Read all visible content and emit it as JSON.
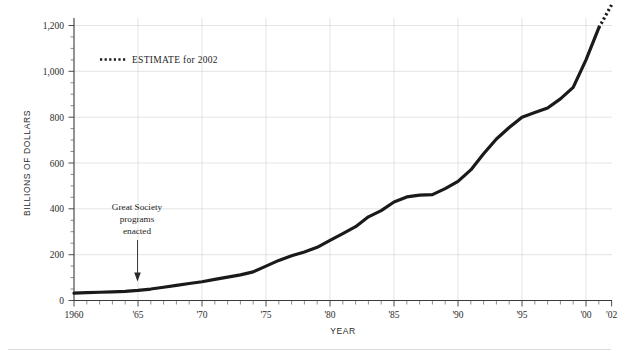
{
  "chart_data": {
    "type": "line",
    "title": "",
    "xlabel": "YEAR",
    "ylabel": "BILLIONS OF DOLLARS",
    "xlim": [
      1960,
      2002
    ],
    "ylim": [
      0,
      1300
    ],
    "y_ticks": [
      0,
      200,
      400,
      600,
      800,
      1000,
      1200
    ],
    "y_tick_labels": [
      "0",
      "200",
      "400",
      "600",
      "800",
      "1,000",
      "1,200"
    ],
    "x_ticks": [
      1960,
      1965,
      1970,
      1975,
      1980,
      1985,
      1990,
      1995,
      2000,
      2002
    ],
    "x_tick_labels": [
      "1960",
      "'65",
      "'70",
      "'75",
      "'80",
      "'85",
      "'90",
      "'95",
      "'00",
      "'02"
    ],
    "x_minor_tick_interval": 1,
    "y_minor_tick_interval": 50,
    "grid": "horizontal-and-vertical-at-major-ticks",
    "legend_position": "upper-left-inside",
    "series": [
      {
        "name": "Actual",
        "style": "solid",
        "x": [
          1960,
          1961,
          1962,
          1963,
          1964,
          1965,
          1966,
          1967,
          1968,
          1969,
          1970,
          1971,
          1972,
          1973,
          1974,
          1975,
          1976,
          1977,
          1978,
          1979,
          1980,
          1981,
          1982,
          1983,
          1984,
          1985,
          1986,
          1987,
          1988,
          1989,
          1990,
          1991,
          1992,
          1993,
          1994,
          1995,
          1996,
          1997,
          1998,
          1999,
          2000,
          2001
        ],
        "values": [
          32,
          34,
          36,
          38,
          40,
          44,
          50,
          58,
          66,
          74,
          82,
          92,
          102,
          112,
          125,
          150,
          175,
          195,
          212,
          232,
          262,
          292,
          322,
          365,
          392,
          430,
          452,
          460,
          462,
          488,
          520,
          570,
          640,
          705,
          755,
          800,
          820,
          840,
          880,
          930,
          1050,
          1190
        ]
      },
      {
        "name": "ESTIMATE for 2002",
        "style": "dotted",
        "x": [
          2001,
          2002
        ],
        "values": [
          1190,
          1290
        ]
      }
    ],
    "legend": [
      {
        "label": "ESTIMATE for 2002",
        "style": "dotted"
      }
    ],
    "annotations": [
      {
        "text_lines": [
          "Great Society",
          "programs",
          "enacted"
        ],
        "points_to_x": 1965,
        "points_to_y": 44,
        "arrow": "down"
      }
    ]
  },
  "axes": {
    "y_title": "BILLIONS OF DOLLARS",
    "x_title": "YEAR"
  },
  "legend": {
    "estimate_label": "ESTIMATE for 2002"
  },
  "annotation": {
    "line1": "Great Society",
    "line2": "programs",
    "line3": "enacted"
  },
  "colors": {
    "line": "#1a1a1a",
    "grid": "#d9d9d9",
    "axis": "#3a3a3a",
    "background": "#ffffff",
    "text": "#1d1d1d"
  },
  "y_tick_labels": {
    "t0": "0",
    "t200": "200",
    "t400": "400",
    "t600": "600",
    "t800": "800",
    "t1000": "1,000",
    "t1200": "1,200"
  },
  "x_tick_labels": {
    "x1960": "1960",
    "x1965": "'65",
    "x1970": "'70",
    "x1975": "'75",
    "x1980": "'80",
    "x1985": "'85",
    "x1990": "'90",
    "x1995": "'95",
    "x2000": "'00",
    "x2002": "'02"
  }
}
